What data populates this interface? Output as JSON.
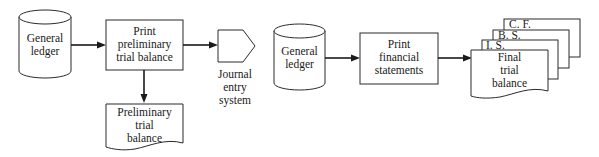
{
  "diagram": {
    "type": "flowchart",
    "left_flow": {
      "general_ledger": {
        "label": "General\nledger",
        "shape": "cylinder"
      },
      "print_preliminary": {
        "label": "Print\npreliminary\ntrial balance",
        "shape": "process"
      },
      "journal_entry": {
        "label": "Journal\nentry\nsystem",
        "shape": "off-page-connector"
      },
      "preliminary_doc": {
        "label": "Preliminary\ntrial\nbalance",
        "shape": "document"
      }
    },
    "right_flow": {
      "general_ledger": {
        "label": "General\nledger",
        "shape": "cylinder"
      },
      "print_financial": {
        "label": "Print\nfinancial\nstatements",
        "shape": "process"
      },
      "docs": {
        "cf": {
          "label": "C. F.",
          "shape": "document"
        },
        "bs": {
          "label": "B. S.",
          "shape": "document"
        },
        "is": {
          "label": "I. S.",
          "shape": "document"
        },
        "final": {
          "label": "Final\ntrial\nbalance",
          "shape": "document"
        }
      }
    },
    "edges": [
      {
        "from": "left_flow.general_ledger",
        "to": "left_flow.print_preliminary"
      },
      {
        "from": "left_flow.print_preliminary",
        "to": "left_flow.journal_entry"
      },
      {
        "from": "left_flow.print_preliminary",
        "to": "left_flow.preliminary_doc"
      },
      {
        "from": "right_flow.general_ledger",
        "to": "right_flow.print_financial"
      },
      {
        "from": "right_flow.print_financial",
        "to": "right_flow.docs.final"
      }
    ],
    "colors": {
      "line": "#1a1a1a",
      "fill": "#ffffff",
      "background": "#ffffff"
    }
  }
}
